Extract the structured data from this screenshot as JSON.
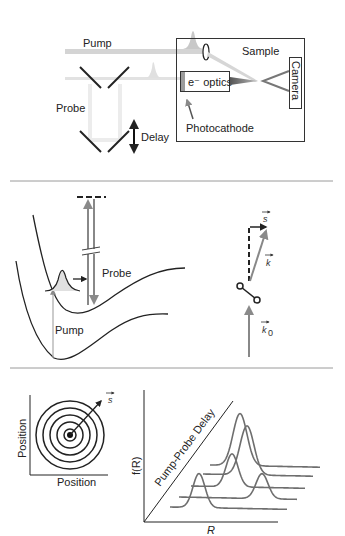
{
  "panel_a": {
    "pump_label": "Pump",
    "probe_label": "Probe",
    "delay_label": "Delay",
    "sample_label": "Sample",
    "optics_label": "e⁻ optics",
    "camera_label": "Camera",
    "photocathode_label": "Photocathode"
  },
  "panel_b": {
    "probe_label": "Probe",
    "pump_label": "Pump",
    "vector_s": "s",
    "vector_k": "k",
    "vector_k0_base": "k",
    "vector_k0_sub": "0"
  },
  "panel_c": {
    "pattern_xlabel": "Position",
    "pattern_ylabel": "Position",
    "vector_s": "s",
    "plot_ylabel": "f(R)",
    "plot_xlabel": "R",
    "diagonal_label": "Pump-Probe Delay"
  },
  "colors": {
    "beam": "#d4d4d4",
    "arrow_gray": "#8a8a8a",
    "curve_gray": "#6e6e6e",
    "ink": "#222222",
    "divider": "#9a9a9a"
  }
}
